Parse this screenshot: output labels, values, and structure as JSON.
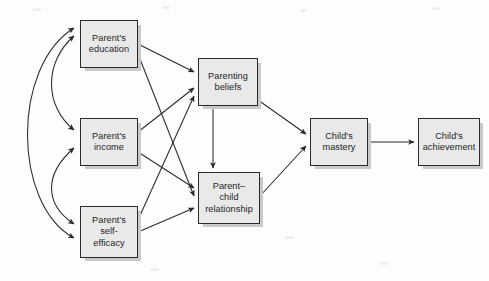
{
  "figure": {
    "type": "path-diagram",
    "title": "",
    "background_color": "#fdfdfd",
    "node_fill_color": "#e9e9e9",
    "node_border_color": "#2b2b2b",
    "arrow_color": "#2b2b2b"
  },
  "nodes": [
    {
      "id": "parent-education",
      "label": "Parent's\neducation",
      "x": 80,
      "y": 20,
      "w": 58,
      "h": 48
    },
    {
      "id": "parent-income",
      "label": "Parent's\nincome",
      "x": 80,
      "y": 118,
      "w": 58,
      "h": 48
    },
    {
      "id": "parent-self-efficacy",
      "label": "Parent's\nself-\nefficacy",
      "x": 80,
      "y": 206,
      "w": 58,
      "h": 52
    },
    {
      "id": "parenting-beliefs",
      "label": "Parenting\nbeliefs",
      "x": 198,
      "y": 58,
      "w": 60,
      "h": 48
    },
    {
      "id": "parent-child-relationship",
      "label": "Parent–\nchild\nrelationship",
      "x": 198,
      "y": 172,
      "w": 62,
      "h": 52
    },
    {
      "id": "child-mastery",
      "label": "Child's\nmastery",
      "x": 310,
      "y": 118,
      "w": 58,
      "h": 48
    },
    {
      "id": "child-achievement",
      "label": "Child's\nachievement",
      "x": 418,
      "y": 118,
      "w": 62,
      "h": 48
    }
  ],
  "edges": [
    {
      "id": "edu-to-beliefs",
      "from": "parent-education",
      "to": "parenting-beliefs",
      "kind": "directed"
    },
    {
      "id": "edu-to-relationship",
      "from": "parent-education",
      "to": "parent-child-relationship",
      "kind": "directed"
    },
    {
      "id": "income-to-beliefs",
      "from": "parent-income",
      "to": "parenting-beliefs",
      "kind": "directed"
    },
    {
      "id": "income-to-relationship",
      "from": "parent-income",
      "to": "parent-child-relationship",
      "kind": "directed"
    },
    {
      "id": "efficacy-to-beliefs",
      "from": "parent-self-efficacy",
      "to": "parenting-beliefs",
      "kind": "directed"
    },
    {
      "id": "efficacy-to-relationship",
      "from": "parent-self-efficacy",
      "to": "parent-child-relationship",
      "kind": "directed"
    },
    {
      "id": "beliefs-to-relationship",
      "from": "parenting-beliefs",
      "to": "parent-child-relationship",
      "kind": "directed"
    },
    {
      "id": "beliefs-to-mastery",
      "from": "parenting-beliefs",
      "to": "child-mastery",
      "kind": "directed"
    },
    {
      "id": "relationship-to-mastery",
      "from": "parent-child-relationship",
      "to": "child-mastery",
      "kind": "directed"
    },
    {
      "id": "mastery-to-achievement",
      "from": "child-mastery",
      "to": "child-achievement",
      "kind": "directed"
    },
    {
      "id": "edu-income-correlation",
      "from": "parent-education",
      "to": "parent-income",
      "kind": "bidirectional-curve"
    },
    {
      "id": "income-efficacy-correlation",
      "from": "parent-income",
      "to": "parent-self-efficacy",
      "kind": "bidirectional-curve"
    },
    {
      "id": "edu-efficacy-correlation",
      "from": "parent-education",
      "to": "parent-self-efficacy",
      "kind": "bidirectional-curve"
    }
  ]
}
